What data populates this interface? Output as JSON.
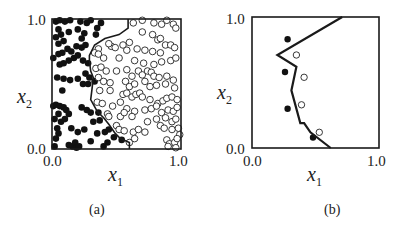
{
  "chart_data": [
    {
      "panel": "(a)",
      "type": "scatter",
      "caption": "(a)",
      "xlabel": "x1",
      "ylabel": "x2",
      "x_ticks": [
        "0.0",
        "1.0"
      ],
      "y_ticks": [
        "0.0",
        "1.0"
      ],
      "xlim": [
        0,
        1
      ],
      "ylim": [
        0,
        1
      ],
      "grid": false,
      "legend": "none",
      "series": [
        {
          "name": "class filled (black dots)",
          "marker": "filled-circle",
          "points": [
            [
              0.03,
              0.98
            ],
            [
              0.06,
              0.99
            ],
            [
              0.1,
              0.98
            ],
            [
              0.14,
              0.99
            ],
            [
              0.22,
              0.98
            ],
            [
              0.27,
              0.97
            ],
            [
              0.3,
              0.99
            ],
            [
              0.05,
              0.92
            ],
            [
              0.03,
              0.86
            ],
            [
              0.07,
              0.88
            ],
            [
              0.05,
              0.81
            ],
            [
              0.09,
              0.83
            ],
            [
              0.13,
              0.9
            ],
            [
              0.2,
              0.92
            ],
            [
              0.25,
              0.89
            ],
            [
              0.35,
              0.93
            ],
            [
              0.38,
              0.97
            ],
            [
              0.34,
              0.88
            ],
            [
              0.23,
              0.85
            ],
            [
              0.01,
              0.7
            ],
            [
              0.05,
              0.73
            ],
            [
              0.08,
              0.74
            ],
            [
              0.12,
              0.77
            ],
            [
              0.15,
              0.75
            ],
            [
              0.19,
              0.79
            ],
            [
              0.23,
              0.78
            ],
            [
              0.26,
              0.8
            ],
            [
              0.06,
              0.65
            ],
            [
              0.09,
              0.66
            ],
            [
              0.13,
              0.68
            ],
            [
              0.17,
              0.7
            ],
            [
              0.2,
              0.72
            ],
            [
              0.24,
              0.68
            ],
            [
              0.28,
              0.66
            ],
            [
              0.04,
              0.55
            ],
            [
              0.09,
              0.54
            ],
            [
              0.14,
              0.53
            ],
            [
              0.2,
              0.54
            ],
            [
              0.26,
              0.58
            ],
            [
              0.29,
              0.55
            ],
            [
              0.08,
              0.45
            ],
            [
              0.24,
              0.5
            ],
            [
              0.28,
              0.5
            ],
            [
              0.33,
              0.52
            ],
            [
              0.01,
              0.33
            ],
            [
              0.03,
              0.34
            ],
            [
              0.06,
              0.33
            ],
            [
              0.09,
              0.32
            ],
            [
              0.11,
              0.3
            ],
            [
              0.13,
              0.27
            ],
            [
              0.05,
              0.27
            ],
            [
              0.02,
              0.23
            ],
            [
              0.07,
              0.21
            ],
            [
              0.1,
              0.23
            ],
            [
              0.23,
              0.32
            ],
            [
              0.27,
              0.3
            ],
            [
              0.3,
              0.28
            ],
            [
              0.36,
              0.28
            ],
            [
              0.32,
              0.21
            ],
            [
              0.37,
              0.22
            ],
            [
              0.04,
              0.16
            ],
            [
              0.05,
              0.12
            ],
            [
              0.03,
              0.08
            ],
            [
              0.15,
              0.16
            ],
            [
              0.2,
              0.13
            ],
            [
              0.25,
              0.15
            ],
            [
              0.35,
              0.12
            ],
            [
              0.41,
              0.13
            ],
            [
              0.44,
              0.15
            ],
            [
              0.48,
              0.09
            ],
            [
              0.13,
              0.03
            ],
            [
              0.16,
              0.02
            ],
            [
              0.18,
              0.05
            ],
            [
              0.19,
              0.01
            ],
            [
              0.21,
              0.02
            ],
            [
              0.3,
              0.06
            ],
            [
              0.43,
              0.05
            ],
            [
              0.54,
              0.07
            ],
            [
              0.4,
              0.02
            ],
            [
              0.02,
              0.02
            ]
          ]
        },
        {
          "name": "class open (hollow circles)",
          "marker": "open-circle",
          "points": [
            [
              0.63,
              0.97
            ],
            [
              0.7,
              0.99
            ],
            [
              0.79,
              0.97
            ],
            [
              0.85,
              0.96
            ],
            [
              0.89,
              0.99
            ],
            [
              0.94,
              0.96
            ],
            [
              0.96,
              0.93
            ],
            [
              0.7,
              0.9
            ],
            [
              0.78,
              0.88
            ],
            [
              0.82,
              0.84
            ],
            [
              0.84,
              0.85
            ],
            [
              0.88,
              0.8
            ],
            [
              0.92,
              0.8
            ],
            [
              0.95,
              0.78
            ],
            [
              0.6,
              0.82
            ],
            [
              0.55,
              0.8
            ],
            [
              0.46,
              0.79
            ],
            [
              0.44,
              0.81
            ],
            [
              0.49,
              0.78
            ],
            [
              0.58,
              0.76
            ],
            [
              0.66,
              0.77
            ],
            [
              0.72,
              0.76
            ],
            [
              0.78,
              0.75
            ],
            [
              0.84,
              0.74
            ],
            [
              0.36,
              0.77
            ],
            [
              0.33,
              0.74
            ],
            [
              0.36,
              0.73
            ],
            [
              0.4,
              0.7
            ],
            [
              0.52,
              0.7
            ],
            [
              0.64,
              0.68
            ],
            [
              0.71,
              0.66
            ],
            [
              0.79,
              0.65
            ],
            [
              0.85,
              0.67
            ],
            [
              0.92,
              0.68
            ],
            [
              0.96,
              0.7
            ],
            [
              0.34,
              0.62
            ],
            [
              0.38,
              0.63
            ],
            [
              0.42,
              0.6
            ],
            [
              0.5,
              0.6
            ],
            [
              0.58,
              0.61
            ],
            [
              0.62,
              0.56
            ],
            [
              0.67,
              0.6
            ],
            [
              0.7,
              0.57
            ],
            [
              0.74,
              0.6
            ],
            [
              0.77,
              0.59
            ],
            [
              0.79,
              0.56
            ],
            [
              0.83,
              0.55
            ],
            [
              0.89,
              0.56
            ],
            [
              0.94,
              0.53
            ],
            [
              0.36,
              0.55
            ],
            [
              0.4,
              0.52
            ],
            [
              0.45,
              0.51
            ],
            [
              0.57,
              0.52
            ],
            [
              0.6,
              0.48
            ],
            [
              0.64,
              0.5
            ],
            [
              0.72,
              0.52
            ],
            [
              0.76,
              0.48
            ],
            [
              0.81,
              0.49
            ],
            [
              0.88,
              0.5
            ],
            [
              0.95,
              0.47
            ],
            [
              0.37,
              0.45
            ],
            [
              0.45,
              0.45
            ],
            [
              0.55,
              0.42
            ],
            [
              0.58,
              0.43
            ],
            [
              0.62,
              0.4
            ],
            [
              0.65,
              0.42
            ],
            [
              0.68,
              0.43
            ],
            [
              0.7,
              0.4
            ],
            [
              0.76,
              0.38
            ],
            [
              0.82,
              0.35
            ],
            [
              0.86,
              0.37
            ],
            [
              0.89,
              0.39
            ],
            [
              0.93,
              0.4
            ],
            [
              0.97,
              0.38
            ],
            [
              0.35,
              0.36
            ],
            [
              0.39,
              0.35
            ],
            [
              0.47,
              0.33
            ],
            [
              0.53,
              0.36
            ],
            [
              0.58,
              0.31
            ],
            [
              0.64,
              0.29
            ],
            [
              0.72,
              0.3
            ],
            [
              0.77,
              0.31
            ],
            [
              0.81,
              0.33
            ],
            [
              0.85,
              0.28
            ],
            [
              0.9,
              0.3
            ],
            [
              0.94,
              0.29
            ],
            [
              0.97,
              0.32
            ],
            [
              0.43,
              0.27
            ],
            [
              0.44,
              0.25
            ],
            [
              0.53,
              0.25
            ],
            [
              0.56,
              0.28
            ],
            [
              0.62,
              0.25
            ],
            [
              0.74,
              0.21
            ],
            [
              0.81,
              0.23
            ],
            [
              0.88,
              0.24
            ],
            [
              0.93,
              0.21
            ],
            [
              0.96,
              0.23
            ],
            [
              0.5,
              0.18
            ],
            [
              0.52,
              0.15
            ],
            [
              0.56,
              0.14
            ],
            [
              0.63,
              0.13
            ],
            [
              0.67,
              0.15
            ],
            [
              0.72,
              0.13
            ],
            [
              0.84,
              0.18
            ],
            [
              0.87,
              0.16
            ],
            [
              0.93,
              0.15
            ],
            [
              0.98,
              0.16
            ],
            [
              0.99,
              0.11
            ],
            [
              0.6,
              0.05
            ],
            [
              0.64,
              0.08
            ],
            [
              0.89,
              0.07
            ],
            [
              0.91,
              0.04
            ],
            [
              0.95,
              0.05
            ],
            [
              0.97,
              0.08
            ],
            [
              0.9,
              0.02
            ],
            [
              0.96,
              0.01
            ]
          ]
        },
        {
          "name": "decision boundary",
          "marker": "line",
          "points": [
            [
              0.59,
              1.0
            ],
            [
              0.59,
              0.93
            ],
            [
              0.52,
              0.88
            ],
            [
              0.41,
              0.85
            ],
            [
              0.33,
              0.8
            ],
            [
              0.29,
              0.72
            ],
            [
              0.29,
              0.68
            ],
            [
              0.3,
              0.6
            ],
            [
              0.32,
              0.55
            ],
            [
              0.31,
              0.46
            ],
            [
              0.3,
              0.38
            ],
            [
              0.35,
              0.29
            ],
            [
              0.4,
              0.24
            ],
            [
              0.44,
              0.19
            ],
            [
              0.49,
              0.12
            ],
            [
              0.53,
              0.08
            ],
            [
              0.6,
              0.05
            ],
            [
              0.6,
              0.0
            ]
          ]
        }
      ]
    },
    {
      "panel": "(b)",
      "type": "scatter",
      "caption": "(b)",
      "xlabel": "x1",
      "ylabel": "x2",
      "x_ticks": [
        "0.0",
        "1.0"
      ],
      "y_ticks": [
        "0.0",
        "1.0"
      ],
      "xlim": [
        0,
        1
      ],
      "ylim": [
        0,
        1
      ],
      "grid": false,
      "legend": "none",
      "series": [
        {
          "name": "class filled (black dots)",
          "marker": "filled-circle",
          "points": [
            [
              0.28,
              0.83
            ],
            [
              0.26,
              0.58
            ],
            [
              0.28,
              0.3
            ],
            [
              0.48,
              0.08
            ]
          ]
        },
        {
          "name": "class open (hollow circles)",
          "marker": "open-circle",
          "points": [
            [
              0.35,
              0.71
            ],
            [
              0.41,
              0.54
            ],
            [
              0.39,
              0.33
            ],
            [
              0.53,
              0.12
            ]
          ]
        },
        {
          "name": "decision boundary",
          "marker": "line",
          "points": [
            [
              0.71,
              1.0
            ],
            [
              0.2,
              0.71
            ],
            [
              0.35,
              0.62
            ],
            [
              0.31,
              0.44
            ],
            [
              0.38,
              0.19
            ],
            [
              0.41,
              0.19
            ],
            [
              0.46,
              0.12
            ],
            [
              0.62,
              0.0
            ]
          ]
        }
      ]
    }
  ],
  "panels": [
    {
      "caption": "(a)",
      "xlabel_main": "x",
      "xlabel_sub": "1",
      "ylabel_main": "x",
      "ylabel_sub": "2",
      "x_tick_min": "0.0",
      "x_tick_max": "1.0",
      "y_tick_min": "0.0",
      "y_tick_max": "1.0"
    },
    {
      "caption": "(b)",
      "xlabel_main": "x",
      "xlabel_sub": "1",
      "ylabel_main": "x",
      "ylabel_sub": "2",
      "x_tick_min": "0.0",
      "x_tick_max": "1.0",
      "y_tick_min": "0.0",
      "y_tick_max": "1.0"
    }
  ],
  "colors": {
    "ink": "#1a1a1a",
    "background": "#ffffff"
  }
}
